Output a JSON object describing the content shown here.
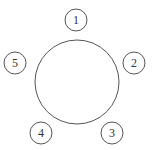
{
  "diagram": {
    "center_circle": {
      "cx": 77,
      "cy": 82,
      "r": 42
    },
    "nodes": [
      {
        "label": "1",
        "cx": 76,
        "cy": 20,
        "r": 11
      },
      {
        "label": "2",
        "cx": 134,
        "cy": 63,
        "r": 11
      },
      {
        "label": "3",
        "cx": 112,
        "cy": 133,
        "r": 11
      },
      {
        "label": "4",
        "cx": 41,
        "cy": 133,
        "r": 11
      },
      {
        "label": "5",
        "cx": 15,
        "cy": 63,
        "r": 11
      }
    ],
    "stroke_color": "#555555",
    "background": "#ffffff"
  }
}
